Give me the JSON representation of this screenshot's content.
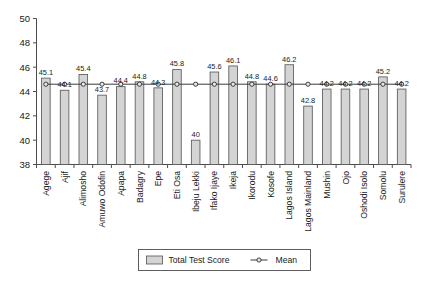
{
  "chart_data": {
    "type": "bar",
    "title": "",
    "subtitle": "",
    "xlabel": "",
    "ylabel": "",
    "ylim": [
      38,
      50
    ],
    "yticks": [
      38,
      40,
      42,
      44,
      46,
      48,
      50
    ],
    "grid": false,
    "legend_position": "bottom",
    "categories": [
      "Agege",
      "Ajif",
      "Alimosho",
      "Amuwo Odofin",
      "Apapa",
      "Badagry",
      "Epe",
      "Eti Osa",
      "Ibeju Lekki",
      "Ifako Ijaye",
      "Ikeja",
      "Ikorodu",
      "Kosofe",
      "Lagos Island",
      "Lagos Mainland",
      "Mushin",
      "Ojo",
      "Oshodi Isolo",
      "Somolu",
      "Surulere"
    ],
    "series": [
      {
        "name": "Total Test Score",
        "type": "bar",
        "values": [
          45.1,
          44.1,
          45.4,
          43.7,
          44.4,
          44.8,
          44.3,
          45.8,
          40,
          45.6,
          46.1,
          44.8,
          44.6,
          46.2,
          42.8,
          44.2,
          44.2,
          44.2,
          45.2,
          44.2
        ]
      },
      {
        "name": "Mean",
        "type": "line",
        "values": [
          44.6,
          44.6,
          44.6,
          44.6,
          44.6,
          44.6,
          44.6,
          44.6,
          44.6,
          44.6,
          44.6,
          44.6,
          44.6,
          44.6,
          44.6,
          44.6,
          44.6,
          44.6,
          44.6,
          44.6
        ]
      }
    ],
    "data_labels": [
      "45.1",
      "44.1",
      "45.4",
      "43.7",
      "44.4",
      "44.8",
      "44.3",
      "45.8",
      "40",
      "45.6",
      "46.1",
      "44.8",
      "44.6",
      "46.2",
      "42.8",
      "44.2",
      "44.2",
      "44.2",
      "45.2",
      "44.2"
    ],
    "colors": {
      "bar_fill": "#d4d4d4",
      "bar_stroke": "#5a5a5a",
      "mean_line": "#3a3a3a",
      "axis": "#4d4d4d",
      "text": "#1a1a1a",
      "background": "#ffffff"
    }
  },
  "legend": {
    "items": [
      {
        "label": "Total Test Score",
        "marker": "swatch"
      },
      {
        "label": "Mean",
        "marker": "line-dot"
      }
    ]
  }
}
